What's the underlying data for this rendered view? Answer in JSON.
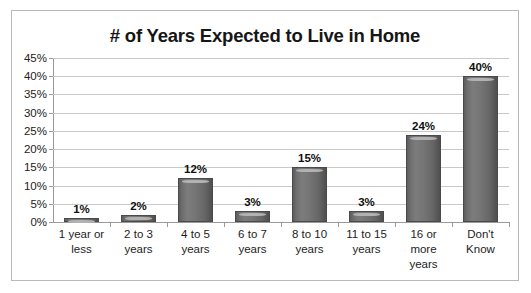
{
  "chart_data": {
    "type": "bar",
    "title": "# of Years Expected to Live in Home",
    "xlabel": "",
    "ylabel": "",
    "categories": [
      "1 year or less",
      "2 to 3 years",
      "4 to 5 years",
      "6 to 7 years",
      "8 to 10 years",
      "11 to 15 years",
      "16 or more years",
      "Don't Know"
    ],
    "category_lines": [
      [
        "1 year or",
        "less"
      ],
      [
        "2 to 3",
        "years"
      ],
      [
        "4 to 5",
        "years"
      ],
      [
        "6 to 7",
        "years"
      ],
      [
        "8 to 10",
        "years"
      ],
      [
        "11 to 15",
        "years"
      ],
      [
        "16 or",
        "more",
        "years"
      ],
      [
        "Don't",
        "Know"
      ]
    ],
    "values": [
      1,
      2,
      12,
      3,
      15,
      3,
      24,
      40
    ],
    "data_labels": [
      "1%",
      "2%",
      "12%",
      "3%",
      "15%",
      "3%",
      "24%",
      "40%"
    ],
    "ylim": [
      0,
      45
    ],
    "ytick_values": [
      0,
      5,
      10,
      15,
      20,
      25,
      30,
      35,
      40,
      45
    ],
    "ytick_labels": [
      "0%",
      "5%",
      "10%",
      "15%",
      "20%",
      "25%",
      "30%",
      "35%",
      "40%",
      "45%"
    ],
    "grid": true,
    "grid_axis": "y",
    "legend": false,
    "legend_position": "none",
    "series": [
      {
        "name": "Percent of respondents",
        "values": [
          1,
          2,
          12,
          3,
          15,
          3,
          24,
          40
        ]
      }
    ],
    "units": "percent",
    "colors": {
      "bar_fill": "#757575",
      "bar_edge": "#4a4a4a",
      "bar_highlight": "#b2b2b2",
      "gridline": "#c9c9c9",
      "axis": "#9a9a9a",
      "text": "#1d1d1d",
      "title": "#161616",
      "frame_border": "#b9b9b9",
      "background": "#ffffff"
    }
  }
}
